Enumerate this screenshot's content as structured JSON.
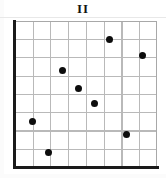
{
  "chart_data": {
    "type": "scatter",
    "title": "II",
    "xlabel": "",
    "ylabel": "",
    "xlim": [
      0,
      8
    ],
    "ylim": [
      0,
      8
    ],
    "grid": true,
    "grid_cells_x": 8,
    "grid_cells_y": 8,
    "legend": null,
    "tick_labels_x": [],
    "tick_labels_y": [],
    "marker": "filled-circle",
    "marker_color": "#0d0d0d",
    "points": [
      {
        "x": 1.0,
        "y": 2.5
      },
      {
        "x": 1.9,
        "y": 0.8
      },
      {
        "x": 2.7,
        "y": 5.3
      },
      {
        "x": 3.6,
        "y": 4.3
      },
      {
        "x": 4.5,
        "y": 3.5
      },
      {
        "x": 5.3,
        "y": 7.0
      },
      {
        "x": 6.3,
        "y": 1.8
      },
      {
        "x": 7.2,
        "y": 6.1
      }
    ]
  },
  "figure": {
    "background": "#ffffff",
    "axis_color": "#1a1a1a",
    "grid_color": "#b9b9b9",
    "frame_border_color": "#a8a8a8"
  }
}
